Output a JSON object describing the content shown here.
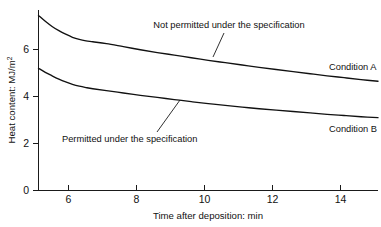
{
  "chart_data": {
    "type": "line",
    "title": "",
    "xlabel": "Time after deposition: min",
    "ylabel": "Heat content: MJ/m",
    "ylabel_superscript": "2",
    "xlim": [
      5,
      15
    ],
    "ylim": [
      0,
      7.6
    ],
    "xticks": [
      6,
      8,
      10,
      12,
      14
    ],
    "xtick_labels": [
      "6",
      "8",
      "10",
      "12",
      "14"
    ],
    "yticks": [
      0,
      2,
      4,
      6
    ],
    "ytick_labels": [
      "0",
      "2",
      "4",
      "6"
    ],
    "grid": false,
    "legend": "inline-labels",
    "series": [
      {
        "name": "Condition A",
        "label": "Condition A",
        "x": [
          5.0,
          5.2,
          5.4,
          5.6,
          5.8,
          6.0,
          6.2,
          6.4,
          6.6,
          7.0,
          7.5,
          8.0,
          8.5,
          9.0,
          9.5,
          10.0,
          10.5,
          11.0,
          11.5,
          12.0,
          12.5,
          13.0,
          13.5,
          14.0,
          14.5,
          15.0
        ],
        "y": [
          7.45,
          7.2,
          6.98,
          6.8,
          6.65,
          6.52,
          6.43,
          6.37,
          6.33,
          6.25,
          6.12,
          5.99,
          5.87,
          5.76,
          5.65,
          5.54,
          5.44,
          5.34,
          5.24,
          5.15,
          5.06,
          4.97,
          4.88,
          4.8,
          4.72,
          4.65
        ]
      },
      {
        "name": "Condition B",
        "label": "Condition B",
        "x": [
          5.0,
          5.2,
          5.4,
          5.6,
          5.8,
          6.0,
          6.2,
          6.4,
          6.6,
          7.0,
          7.5,
          8.0,
          8.5,
          9.0,
          9.5,
          10.0,
          10.5,
          11.0,
          11.5,
          12.0,
          12.5,
          13.0,
          13.5,
          14.0,
          14.5,
          15.0
        ],
        "y": [
          5.2,
          5.03,
          4.88,
          4.74,
          4.62,
          4.52,
          4.44,
          4.38,
          4.33,
          4.25,
          4.15,
          4.05,
          3.96,
          3.87,
          3.78,
          3.7,
          3.62,
          3.55,
          3.48,
          3.42,
          3.36,
          3.3,
          3.24,
          3.19,
          3.14,
          3.1
        ]
      }
    ],
    "annotations": [
      {
        "text": "Not permitted under the specification",
        "target_series": "Condition A",
        "text_x": 229,
        "text_y": 28,
        "leader_from_x": 224,
        "leader_from_y": 33,
        "leader_to_x": 213,
        "leader_to_y": 57
      },
      {
        "text": "Permitted under the specification",
        "target_series": "Condition B",
        "text_x": 62,
        "text_y": 141,
        "leader_from_x": 157,
        "leader_from_y": 132,
        "leader_to_x": 180,
        "leader_to_y": 100
      }
    ]
  },
  "axes": {
    "x_title": "Time after deposition: min",
    "y_title_base": "Heat content: MJ/m",
    "y_title_sup": "2"
  },
  "labels": {
    "condition_a": "Condition A",
    "condition_b": "Condition B",
    "not_permitted": "Not permitted under the specification",
    "permitted": "Permitted under the specification"
  },
  "ticks": {
    "x": [
      "6",
      "8",
      "10",
      "12",
      "14"
    ],
    "y": [
      "6",
      "4",
      "2",
      "0"
    ]
  },
  "colors": {
    "background": "#ffffff",
    "ink": "#111111",
    "axis": "#1a1a1a"
  }
}
